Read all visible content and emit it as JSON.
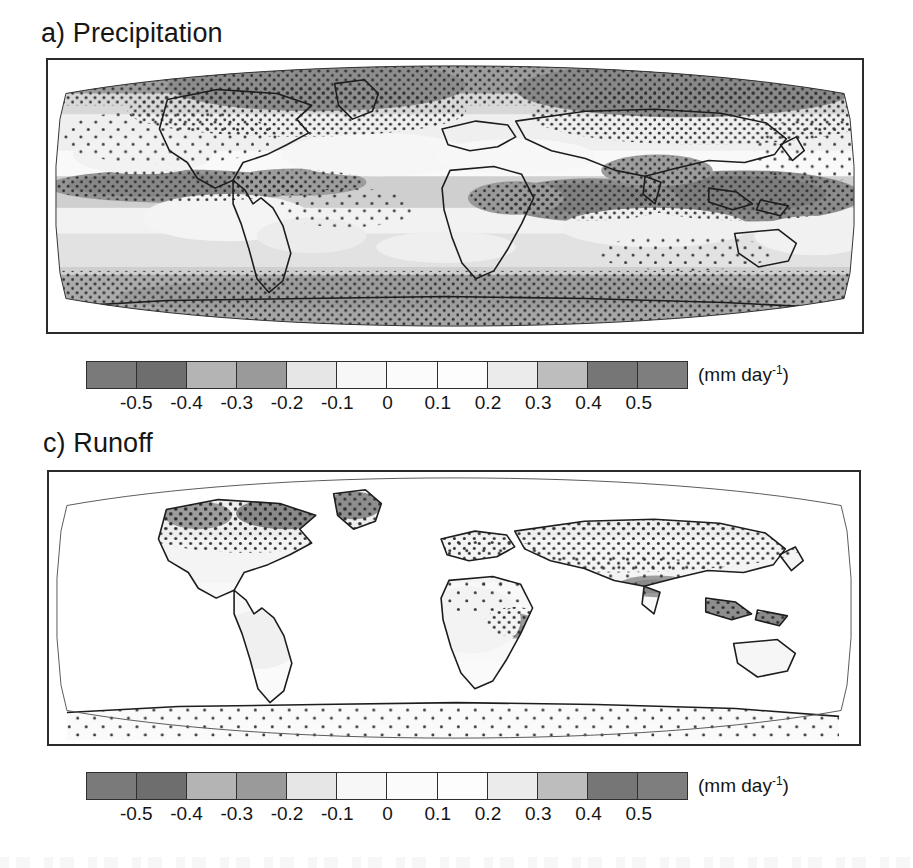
{
  "figure": {
    "kind": "two-panel global map figure",
    "units_label_html": "(mm day⁻¹)"
  },
  "panels": [
    {
      "id": "a",
      "title": "a) Precipitation",
      "variable": "Precipitation",
      "projection": "Robinson",
      "coverage": "global (ocean and land)",
      "stippling": "dotted stipple marks statistically significant change"
    },
    {
      "id": "c",
      "title": "c) Runoff",
      "variable": "Runoff",
      "projection": "Robinson",
      "coverage": "land only (ocean left blank)",
      "stippling": "dotted stipple marks statistically significant change"
    }
  ],
  "colorbar": {
    "units": "(mm day",
    "units_exponent": "-1",
    "units_close": ")",
    "tick_labels": [
      "-0.5",
      "-0.4",
      "-0.3",
      "-0.2",
      "-0.1",
      "0",
      "0.1",
      "0.2",
      "0.3",
      "0.4",
      "0.5"
    ],
    "cell_count": 12,
    "cell_colors": [
      "#7a7a7a",
      "#6e6e6e",
      "#b4b4b4",
      "#9a9a9a",
      "#e6e6e6",
      "#f7f7f7",
      "#fbfbfb",
      "#fdfdfd",
      "#ebebeb",
      "#bdbdbd",
      "#767676",
      "#7e7e7e"
    ],
    "border_color": "#2f2f2f"
  },
  "chart_data": {
    "type": "heatmap",
    "subplots": [
      {
        "label": "a) Precipitation",
        "type": "heatmap",
        "projection": "Robinson",
        "zlabel": "(mm day^-1)",
        "zlim": [
          -0.6,
          0.6
        ],
        "colorbar_ticks": [
          -0.5,
          -0.4,
          -0.3,
          -0.2,
          -0.1,
          0,
          0.1,
          0.2,
          0.3,
          0.4,
          0.5
        ],
        "contour_levels": [
          -0.6,
          -0.5,
          -0.4,
          -0.3,
          -0.2,
          -0.1,
          0,
          0.1,
          0.2,
          0.3,
          0.4,
          0.5,
          0.6
        ],
        "colormap": "grayscale-diverging",
        "grid": false,
        "legend": "horizontal colorbar below panel",
        "regions": [
          {
            "name": "Arctic and high northern latitudes",
            "value": 0.3,
            "significant": true
          },
          {
            "name": "Northern Canada and Greenland",
            "value": 0.35,
            "significant": true
          },
          {
            "name": "Northern Europe and Scandinavia",
            "value": 0.3,
            "significant": true
          },
          {
            "name": "Siberia and northern Asia",
            "value": 0.3,
            "significant": true
          },
          {
            "name": "Equatorial Pacific ITCZ",
            "value": 0.45,
            "significant": true
          },
          {
            "name": "Western equatorial Pacific / warm pool",
            "value": 0.5,
            "significant": true
          },
          {
            "name": "Indian Ocean and maritime continent",
            "value": 0.4,
            "significant": true
          },
          {
            "name": "Eastern equatorial Africa",
            "value": 0.3,
            "significant": true
          },
          {
            "name": "Tropical Atlantic ITCZ",
            "value": 0.3,
            "significant": true
          },
          {
            "name": "Subtropical North Atlantic",
            "value": -0.2,
            "significant": false
          },
          {
            "name": "Mediterranean and North Africa",
            "value": -0.2,
            "significant": true
          },
          {
            "name": "Central America and Caribbean",
            "value": -0.25,
            "significant": true
          },
          {
            "name": "Subtropical South Pacific",
            "value": -0.2,
            "significant": false
          },
          {
            "name": "Southwestern North America",
            "value": -0.2,
            "significant": false
          },
          {
            "name": "Southern Ocean storm track",
            "value": 0.25,
            "significant": true
          },
          {
            "name": "Antarctic continent",
            "value": 0.15,
            "significant": true
          },
          {
            "name": "Amazon basin",
            "value": -0.1,
            "significant": false
          },
          {
            "name": "Southern Africa",
            "value": -0.1,
            "significant": false
          },
          {
            "name": "Australia interior",
            "value": -0.05,
            "significant": false
          }
        ]
      },
      {
        "label": "c) Runoff",
        "type": "heatmap",
        "projection": "Robinson",
        "zlabel": "(mm day^-1)",
        "zlim": [
          -0.6,
          0.6
        ],
        "colorbar_ticks": [
          -0.5,
          -0.4,
          -0.3,
          -0.2,
          -0.1,
          0,
          0.1,
          0.2,
          0.3,
          0.4,
          0.5
        ],
        "contour_levels": [
          -0.6,
          -0.5,
          -0.4,
          -0.3,
          -0.2,
          -0.1,
          0,
          0.1,
          0.2,
          0.3,
          0.4,
          0.5,
          0.6
        ],
        "colormap": "grayscale-diverging",
        "grid": false,
        "legend": "horizontal colorbar below panel",
        "regions": [
          {
            "name": "Northern Canada and Alaska",
            "value": 0.2,
            "significant": true
          },
          {
            "name": "Greenland margin",
            "value": 0.25,
            "significant": true
          },
          {
            "name": "Northern Europe and Scandinavia",
            "value": 0.15,
            "significant": true
          },
          {
            "name": "Siberia and northern Asia",
            "value": 0.15,
            "significant": true
          },
          {
            "name": "Central Asia",
            "value": 0.05,
            "significant": true
          },
          {
            "name": "Himalaya and Tibetan Plateau",
            "value": 0.35,
            "significant": true
          },
          {
            "name": "Southeast Asia and Indonesia",
            "value": 0.4,
            "significant": true
          },
          {
            "name": "New Guinea",
            "value": 0.4,
            "significant": true
          },
          {
            "name": "East Africa highlands",
            "value": 0.3,
            "significant": true
          },
          {
            "name": "Horn of Africa",
            "value": 0.2,
            "significant": true
          },
          {
            "name": "Sahara and North Africa",
            "value": 0.0,
            "significant": false
          },
          {
            "name": "Amazon basin",
            "value": 0.02,
            "significant": false
          },
          {
            "name": "Southern South America",
            "value": 0.05,
            "significant": false
          },
          {
            "name": "Australia",
            "value": 0.0,
            "significant": false
          },
          {
            "name": "Antarctic coastal margin",
            "value": 0.1,
            "significant": true
          },
          {
            "name": "Mediterranean Europe",
            "value": -0.05,
            "significant": true
          }
        ]
      }
    ]
  }
}
